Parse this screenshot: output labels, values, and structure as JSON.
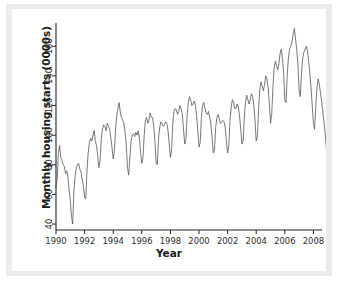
{
  "chart_data": {
    "type": "line",
    "title": "",
    "subtitle": "",
    "xlabel": "Year",
    "ylabel": "Monthly housing starts (0000s)",
    "xlim": [
      1990.0,
      2008.6
    ],
    "ylim": [
      36,
      173
    ],
    "xticks": [
      1990,
      1992,
      1994,
      1996,
      1998,
      2000,
      2002,
      2004,
      2006,
      2008
    ],
    "xtick_labels": [
      "1990",
      "1992",
      "1994",
      "1996",
      "1998",
      "2000",
      "2002",
      "2004",
      "2006",
      "2008"
    ],
    "yticks": [
      40,
      60,
      80,
      100,
      120,
      140,
      160
    ],
    "ytick_labels": [
      "40",
      "60",
      "80",
      "100",
      "120",
      "140",
      "160"
    ],
    "grid": false,
    "legend": null,
    "legend_position": "none",
    "axis_style": "left-and-bottom-spines",
    "line_color": "#555555",
    "line_width": 0.8,
    "background_color": "#ffffff",
    "plate_color": "#ebebeb",
    "series": [
      {
        "name": "Monthly housing starts",
        "x_start": 1990.0,
        "x_step": 0.0833333,
        "values": [
          65,
          70,
          88,
          93,
          85,
          83,
          80,
          79,
          74,
          76,
          72,
          63,
          56,
          45,
          40,
          62,
          72,
          78,
          80,
          81,
          77,
          75,
          70,
          66,
          58,
          57,
          76,
          88,
          95,
          98,
          96,
          100,
          103,
          96,
          93,
          86,
          78,
          83,
          98,
          104,
          107,
          106,
          103,
          108,
          106,
          104,
          98,
          92,
          84,
          89,
          105,
          113,
          118,
          122,
          115,
          112,
          110,
          108,
          102,
          93,
          78,
          73,
          85,
          96,
          100,
          101,
          99,
          102,
          100,
          103,
          98,
          88,
          81,
          85,
          100,
          110,
          112,
          108,
          110,
          115,
          112,
          112,
          106,
          96,
          82,
          80,
          97,
          105,
          109,
          108,
          106,
          107,
          109,
          108,
          103,
          94,
          85,
          90,
          108,
          116,
          118,
          117,
          114,
          116,
          120,
          118,
          114,
          104,
          94,
          97,
          113,
          122,
          126,
          124,
          120,
          121,
          123,
          120,
          113,
          103,
          92,
          95,
          112,
          120,
          122,
          118,
          115,
          114,
          116,
          112,
          107,
          98,
          88,
          90,
          105,
          112,
          114,
          111,
          108,
          109,
          110,
          109,
          105,
          96,
          88,
          93,
          110,
          119,
          124,
          122,
          118,
          118,
          121,
          119,
          113,
          104,
          94,
          96,
          112,
          122,
          127,
          124,
          121,
          124,
          128,
          126,
          120,
          110,
          96,
          99,
          118,
          131,
          136,
          133,
          130,
          134,
          140,
          138,
          132,
          122,
          108,
          114,
          132,
          145,
          150,
          147,
          144,
          148,
          155,
          158,
          152,
          142,
          124,
          122,
          140,
          152,
          158,
          160,
          163,
          168,
          172,
          165,
          158,
          148,
          130,
          126,
          142,
          152,
          156,
          158,
          160,
          157,
          150,
          142,
          132,
          120,
          108,
          104,
          120,
          132,
          138,
          134,
          128,
          122,
          115,
          108,
          100,
          90,
          80,
          76,
          88,
          96,
          100,
          96,
          90,
          84,
          78,
          72,
          66,
          58,
          52,
          50,
          58,
          64,
          66,
          62,
          60
        ]
      }
    ]
  }
}
